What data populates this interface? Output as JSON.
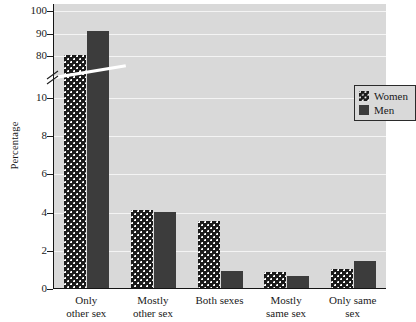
{
  "chart_data": {
    "type": "bar",
    "title": "",
    "xlabel": "",
    "ylabel": "Percentage",
    "categories": [
      "Only other sex",
      "Mostly other sex",
      "Both sexes",
      "Mostly same sex",
      "Only same sex"
    ],
    "category_lines": [
      [
        "Only",
        "other sex"
      ],
      [
        "Mostly",
        "other sex"
      ],
      [
        "Both sexes",
        ""
      ],
      [
        "Mostly",
        "same sex"
      ],
      [
        "Only same",
        "sex"
      ]
    ],
    "series": [
      {
        "name": "Women",
        "values": [
          80.0,
          11.0,
          3.5,
          0.85,
          1.0
        ]
      },
      {
        "name": "Men",
        "values": [
          90.5,
          4.0,
          0.9,
          0.65,
          1.4
        ]
      }
    ],
    "legend": {
      "position": "top-right",
      "entries": [
        "Women",
        "Men"
      ]
    },
    "y_axis": {
      "ticks_lower": [
        0,
        2,
        4,
        6,
        8,
        10
      ],
      "ticks_upper": [
        80,
        90,
        100
      ],
      "axis_break": true,
      "break_between": [
        10,
        80
      ],
      "ylim_lower": [
        0,
        10
      ],
      "ylim_upper": [
        80,
        100
      ]
    },
    "grid": "horizontal",
    "colors": {
      "plot_background": "#d9d9d9",
      "gridline": "#f4f4f4",
      "women_fill": "#1b1b1b",
      "men_fill": "#3c3c3c",
      "axis": "#151515"
    }
  }
}
